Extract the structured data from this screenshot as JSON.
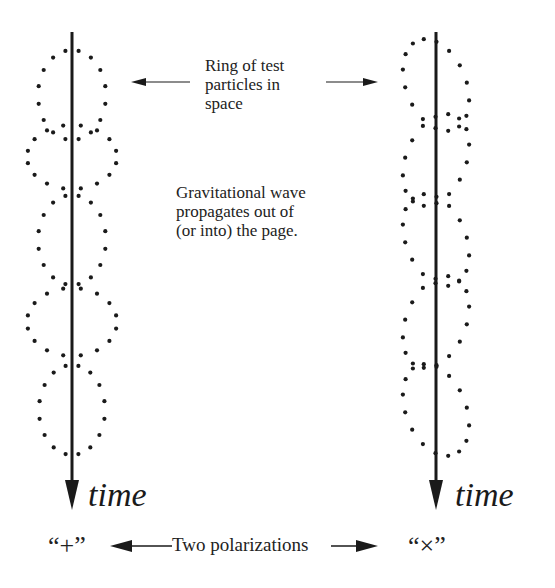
{
  "figure": {
    "ring_label": [
      "Ring of test",
      "particles in",
      "space"
    ],
    "wave_label": [
      "Gravitational wave",
      "propagates out of",
      "(or into) the page."
    ],
    "time_label_left": "time",
    "time_label_right": "time",
    "plus_label": "“+”",
    "cross_label": "“×”",
    "polarizations_label": "Two polarizations",
    "colors": {
      "ink": "#1a1a1a",
      "background": "#ffffff"
    }
  },
  "columns": [
    {
      "name": "plus-polarization",
      "axis_x": 72,
      "axis_top": 32,
      "axis_bottom": 508,
      "rings": [
        {
          "cx": 72,
          "cy": 95,
          "rx": 34,
          "ry": 45,
          "tilt": 0,
          "n": 16
        },
        {
          "cx": 72,
          "cy": 157,
          "rx": 45,
          "ry": 32,
          "tilt": 0,
          "n": 16
        },
        {
          "cx": 72,
          "cy": 240,
          "rx": 34,
          "ry": 45,
          "tilt": 0,
          "n": 16
        },
        {
          "cx": 72,
          "cy": 322,
          "rx": 45,
          "ry": 34,
          "tilt": 0,
          "n": 16
        },
        {
          "cx": 72,
          "cy": 410,
          "rx": 33,
          "ry": 45,
          "tilt": 0,
          "n": 16
        }
      ]
    },
    {
      "name": "cross-polarization",
      "axis_x": 436,
      "axis_top": 32,
      "axis_bottom": 508,
      "rings": [
        {
          "cx": 436,
          "cy": 85,
          "rx": 30,
          "ry": 48,
          "tilt": -22,
          "n": 16
        },
        {
          "cx": 436,
          "cy": 160,
          "rx": 30,
          "ry": 48,
          "tilt": 22,
          "n": 16
        },
        {
          "cx": 436,
          "cy": 240,
          "rx": 30,
          "ry": 48,
          "tilt": -22,
          "n": 16
        },
        {
          "cx": 436,
          "cy": 322,
          "rx": 30,
          "ry": 48,
          "tilt": 22,
          "n": 16
        },
        {
          "cx": 436,
          "cy": 410,
          "rx": 30,
          "ry": 48,
          "tilt": -22,
          "n": 16
        }
      ]
    }
  ]
}
